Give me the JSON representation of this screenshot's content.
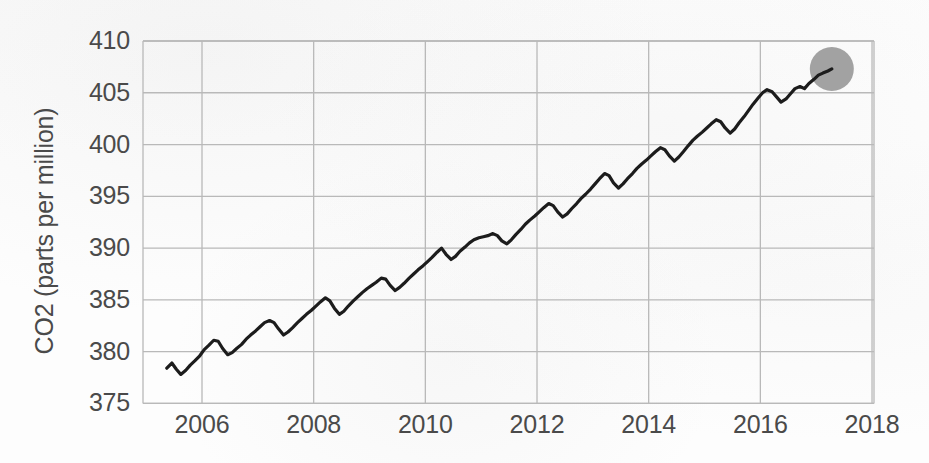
{
  "chart_data": {
    "type": "line",
    "title": "",
    "subtitle": "",
    "xlabel": "",
    "ylabel": "CO2 (parts per million)",
    "xlim": [
      2005.35,
      2018.0
    ],
    "ylim": [
      375,
      410
    ],
    "yticks": [
      375,
      380,
      385,
      390,
      395,
      400,
      405,
      410
    ],
    "xticks": [
      2006,
      2008,
      2010,
      2012,
      2014,
      2016,
      2018
    ],
    "ytick_labels": [
      "375",
      "380",
      "385",
      "390",
      "395",
      "400",
      "405",
      "410"
    ],
    "xtick_labels": [
      "2006",
      "2008",
      "2010",
      "2012",
      "2014",
      "2016",
      "2018"
    ],
    "grid": true,
    "grid_color": "#b9b9b9",
    "line_color": "#1c1c1c",
    "line_width": 3.2,
    "background_color": "#fdfdfd",
    "legend": null,
    "annotations": [
      {
        "name": "end-point-highlight",
        "shape": "circle",
        "x": 2017.28,
        "y": 407.3,
        "radius_px": 22,
        "color": "#a2a2a2"
      }
    ],
    "series": [
      {
        "name": "Atmospheric CO2 (monthly mean)",
        "color": "#1c1c1c",
        "x": [
          2005.37,
          2005.46,
          2005.54,
          2005.62,
          2005.71,
          2005.79,
          2005.87,
          2005.96,
          2006.04,
          2006.12,
          2006.21,
          2006.29,
          2006.37,
          2006.46,
          2006.54,
          2006.62,
          2006.71,
          2006.79,
          2006.87,
          2006.96,
          2007.04,
          2007.12,
          2007.21,
          2007.29,
          2007.37,
          2007.46,
          2007.54,
          2007.62,
          2007.71,
          2007.79,
          2007.87,
          2007.96,
          2008.04,
          2008.12,
          2008.21,
          2008.29,
          2008.37,
          2008.46,
          2008.54,
          2008.62,
          2008.71,
          2008.79,
          2008.87,
          2008.96,
          2009.04,
          2009.12,
          2009.21,
          2009.29,
          2009.37,
          2009.46,
          2009.54,
          2009.62,
          2009.71,
          2009.79,
          2009.87,
          2009.96,
          2010.04,
          2010.12,
          2010.21,
          2010.29,
          2010.37,
          2010.46,
          2010.54,
          2010.62,
          2010.71,
          2010.79,
          2010.87,
          2010.96,
          2011.04,
          2011.12,
          2011.21,
          2011.29,
          2011.37,
          2011.46,
          2011.54,
          2011.62,
          2011.71,
          2011.79,
          2011.87,
          2011.96,
          2012.04,
          2012.12,
          2012.21,
          2012.29,
          2012.37,
          2012.46,
          2012.54,
          2012.62,
          2012.71,
          2012.79,
          2012.87,
          2012.96,
          2013.04,
          2013.12,
          2013.21,
          2013.29,
          2013.37,
          2013.46,
          2013.54,
          2013.62,
          2013.71,
          2013.79,
          2013.87,
          2013.96,
          2014.04,
          2014.12,
          2014.21,
          2014.29,
          2014.37,
          2014.46,
          2014.54,
          2014.62,
          2014.71,
          2014.79,
          2014.87,
          2014.96,
          2015.04,
          2015.12,
          2015.21,
          2015.29,
          2015.37,
          2015.46,
          2015.54,
          2015.62,
          2015.71,
          2015.79,
          2015.87,
          2015.96,
          2016.04,
          2016.12,
          2016.21,
          2016.29,
          2016.37,
          2016.46,
          2016.54,
          2016.62,
          2016.71,
          2016.79,
          2016.87,
          2016.96,
          2017.04,
          2017.12,
          2017.21,
          2017.28
        ],
        "y": [
          378.4,
          378.9,
          378.3,
          377.8,
          378.2,
          378.7,
          379.1,
          379.6,
          380.2,
          380.6,
          381.1,
          381.0,
          380.3,
          379.7,
          379.9,
          380.3,
          380.7,
          381.2,
          381.6,
          382.0,
          382.4,
          382.8,
          383.0,
          382.8,
          382.2,
          381.6,
          381.9,
          382.3,
          382.8,
          383.2,
          383.6,
          384.0,
          384.4,
          384.8,
          385.2,
          384.9,
          384.2,
          383.6,
          383.9,
          384.4,
          384.9,
          385.3,
          385.7,
          386.1,
          386.4,
          386.7,
          387.1,
          387.0,
          386.4,
          385.9,
          386.2,
          386.6,
          387.1,
          387.5,
          387.9,
          388.3,
          388.7,
          389.1,
          389.6,
          390.0,
          389.4,
          388.9,
          389.2,
          389.7,
          390.1,
          390.5,
          390.8,
          391.0,
          391.1,
          391.2,
          391.4,
          391.2,
          390.7,
          390.4,
          390.8,
          391.3,
          391.8,
          392.3,
          392.7,
          393.1,
          393.5,
          393.9,
          394.3,
          394.1,
          393.5,
          393.0,
          393.3,
          393.8,
          394.3,
          394.8,
          395.2,
          395.7,
          396.2,
          396.7,
          397.2,
          397.0,
          396.3,
          395.8,
          396.2,
          396.7,
          397.2,
          397.7,
          398.1,
          398.5,
          398.9,
          399.3,
          399.7,
          399.5,
          398.9,
          398.4,
          398.8,
          399.3,
          399.9,
          400.4,
          400.8,
          401.2,
          401.6,
          402.0,
          402.4,
          402.2,
          401.6,
          401.1,
          401.5,
          402.1,
          402.7,
          403.3,
          403.9,
          404.5,
          405.0,
          405.3,
          405.1,
          404.6,
          404.1,
          404.4,
          404.9,
          405.4,
          405.6,
          405.4,
          405.9,
          406.3,
          406.7,
          406.9,
          407.1,
          407.3
        ]
      }
    ]
  },
  "axis": {
    "y_title": "CO2 (parts per million)"
  }
}
